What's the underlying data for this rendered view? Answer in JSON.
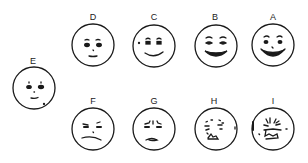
{
  "diagram": {
    "type": "facial-affective-scale",
    "stroke_color": "#1a1a1a",
    "background": "#ffffff",
    "faces": [
      {
        "label": "A",
        "expression": "very happy, broad grin, raised eyebrows",
        "cx": 273,
        "cy": 45,
        "r": 21,
        "label_y": 12
      },
      {
        "label": "B",
        "expression": "happy, wide smile",
        "cx": 216,
        "cy": 46,
        "r": 21,
        "label_y": 12
      },
      {
        "label": "C",
        "expression": "pleasant, gentle smile",
        "cx": 154,
        "cy": 46,
        "r": 21,
        "label_y": 12
      },
      {
        "label": "D",
        "expression": "content, slight smile",
        "cx": 93,
        "cy": 45,
        "r": 21,
        "label_y": 12
      },
      {
        "label": "E",
        "expression": "neutral",
        "cx": 34,
        "cy": 88,
        "r": 21,
        "label_y": 56
      },
      {
        "label": "F",
        "expression": "mildly unhappy, slight frown",
        "cx": 93,
        "cy": 129,
        "r": 21,
        "label_y": 96
      },
      {
        "label": "G",
        "expression": "sad, furrowed brows",
        "cx": 154,
        "cy": 129,
        "r": 21,
        "label_y": 96
      },
      {
        "label": "H",
        "expression": "distressed, grimacing",
        "cx": 216,
        "cy": 129,
        "r": 21,
        "label_y": 96
      },
      {
        "label": "I",
        "expression": "very distressed, crying",
        "cx": 273,
        "cy": 129,
        "r": 21,
        "label_y": 96
      }
    ]
  }
}
